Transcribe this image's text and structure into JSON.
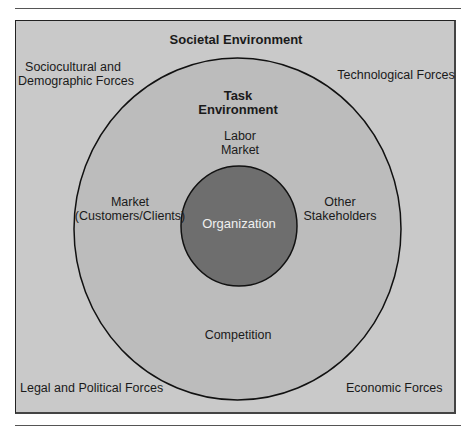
{
  "diagram": {
    "title": "Societal Environment",
    "colors": {
      "frame_bg": "#c9c9c9",
      "task_env_fill": "#bcbcbc",
      "organization_fill": "#6e6e6e",
      "outline": "#111111"
    },
    "societal_forces": {
      "top_left_line1": "Sociocultural and",
      "top_left_line2": "Demographic Forces",
      "top_right": "Technological Forces",
      "bottom_left": "Legal and Political Forces",
      "bottom_right": "Economic Forces"
    },
    "task_environment": {
      "title_line1": "Task",
      "title_line2": "Environment",
      "labor_market_line1": "Labor",
      "labor_market_line2": "Market",
      "market_line1": "Market",
      "market_line2": "(Customers/Clients)",
      "other_line1": "Other",
      "other_line2": "Stakeholders",
      "competition": "Competition"
    },
    "core": {
      "label": "Organization"
    }
  }
}
